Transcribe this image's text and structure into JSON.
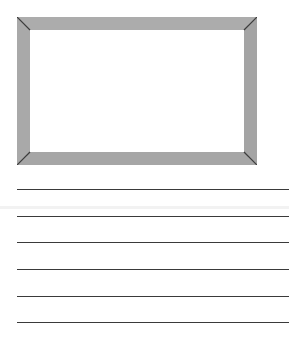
{
  "page": {
    "type": "drawing-and-writing-worksheet"
  },
  "frame": {
    "label": "picture-box",
    "fill_color": "#a9a9a9",
    "edge_color": "#3c3c3c",
    "inner_color": "#ffffff"
  },
  "writing_lines": {
    "count": 6,
    "color": "#3a3a3a",
    "positions_y": [
      189,
      216,
      242,
      269,
      296,
      322
    ]
  }
}
